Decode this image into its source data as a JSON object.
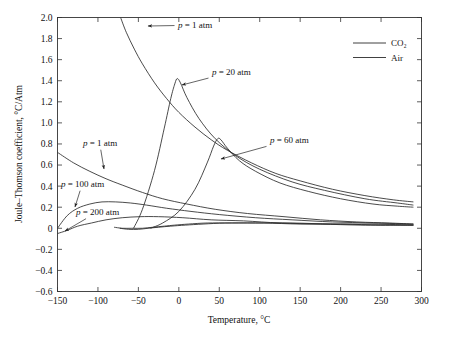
{
  "figure": {
    "background": "#ffffff",
    "line_color": "#2b2b2b",
    "axis_color": "#333333"
  },
  "axes": {
    "x_title": "Temperature, °C",
    "y_title": "Joule–Thomson coefficient, °C/Atm",
    "x_ticks": [
      "−150",
      "−100",
      "−50",
      "0",
      "50",
      "100",
      "150",
      "200",
      "250",
      "300"
    ],
    "x_tick_values": [
      -150,
      -100,
      -50,
      0,
      50,
      100,
      150,
      200,
      250,
      300
    ],
    "y_ticks": [
      "2.0",
      "1.8",
      "1.6",
      "1.4",
      "1.2",
      "1.0",
      "0.8",
      "0.6",
      "0.4",
      "0.2",
      "0",
      "−0.2",
      "−0.4",
      "−0.6"
    ],
    "y_tick_values": [
      2.0,
      1.8,
      1.6,
      1.4,
      1.2,
      1.0,
      0.8,
      0.6,
      0.4,
      0.2,
      0,
      -0.2,
      -0.4,
      -0.6
    ]
  },
  "legend": {
    "position": "top-right",
    "entries": [
      {
        "label": "CO₂",
        "color": "#2b2b2b"
      },
      {
        "label": "Air",
        "color": "#2b2b2b"
      }
    ]
  },
  "annotations": [
    {
      "id": "co2-1atm",
      "text": "p = 1 atm",
      "x": 178,
      "y": 25,
      "arrow_to_x": 148,
      "arrow_to_y": 26
    },
    {
      "id": "co2-20atm",
      "text": "p = 20 atm",
      "x": 212,
      "y": 72,
      "arrow_to_x": 182,
      "arrow_to_y": 85
    },
    {
      "id": "co2-60atm",
      "text": "p = 60 atm",
      "x": 270,
      "y": 140,
      "arrow_to_x": 221,
      "arrow_to_y": 159
    },
    {
      "id": "air-1atm",
      "text": "p = 1 atm",
      "x": 83,
      "y": 143,
      "arrow_to_x": 104,
      "arrow_to_y": 169
    },
    {
      "id": "air-100atm",
      "text": "p = 100 atm",
      "x": 61,
      "y": 184,
      "arrow_to_x": 75,
      "arrow_to_y": 207
    },
    {
      "id": "air-200atm",
      "text": "p = 200 atm",
      "x": 76,
      "y": 212,
      "arrow_to_x": 65,
      "arrow_to_y": 231
    }
  ],
  "chart_data": {
    "type": "line",
    "title": "",
    "xlabel": "Temperature, °C",
    "ylabel": "Joule–Thomson coefficient, °C/Atm",
    "xlim": [
      -150,
      300
    ],
    "ylim": [
      -0.6,
      2.0
    ],
    "grid": false,
    "legend_position": "top-right",
    "series": [
      {
        "name": "CO2, p = 1 atm",
        "gas": "CO₂",
        "pressure_atm": 1,
        "x": [
          -72,
          -65,
          -55,
          -45,
          -30,
          -15,
          0,
          20,
          40,
          60,
          90,
          120,
          150,
          190,
          230,
          265,
          290
        ],
        "y": [
          2.0,
          1.86,
          1.7,
          1.56,
          1.38,
          1.23,
          1.1,
          0.96,
          0.84,
          0.74,
          0.62,
          0.52,
          0.45,
          0.37,
          0.31,
          0.27,
          0.25
        ]
      },
      {
        "name": "CO2, p = 20 atm",
        "gas": "CO₂",
        "pressure_atm": 20,
        "x": [
          -56,
          -45,
          -30,
          -18,
          -10,
          -5,
          -2,
          2,
          10,
          25,
          45,
          70,
          100,
          140,
          180,
          230,
          270,
          290
        ],
        "y": [
          0.0,
          0.18,
          0.55,
          0.95,
          1.23,
          1.37,
          1.42,
          1.38,
          1.24,
          1.04,
          0.85,
          0.69,
          0.56,
          0.44,
          0.36,
          0.28,
          0.24,
          0.22
        ]
      },
      {
        "name": "CO2, p = 60 atm",
        "gas": "CO₂",
        "pressure_atm": 60,
        "x": [
          -35,
          -20,
          0,
          20,
          35,
          43,
          48,
          52,
          60,
          75,
          95,
          125,
          160,
          200,
          240,
          270,
          290
        ],
        "y": [
          0.0,
          0.05,
          0.16,
          0.37,
          0.62,
          0.78,
          0.85,
          0.84,
          0.76,
          0.64,
          0.54,
          0.43,
          0.35,
          0.28,
          0.23,
          0.21,
          0.2
        ]
      },
      {
        "name": "Air, p = 1 atm",
        "gas": "Air",
        "pressure_atm": 1,
        "x": [
          -150,
          -130,
          -110,
          -90,
          -70,
          -45,
          -20,
          10,
          45,
          85,
          130,
          175,
          220,
          260,
          290
        ],
        "y": [
          0.72,
          0.62,
          0.54,
          0.47,
          0.41,
          0.34,
          0.28,
          0.23,
          0.18,
          0.14,
          0.11,
          0.08,
          0.06,
          0.05,
          0.04
        ]
      },
      {
        "name": "Air, p = 100 atm",
        "gas": "Air",
        "pressure_atm": 100,
        "x": [
          -150,
          -138,
          -125,
          -110,
          -95,
          -78,
          -60,
          -40,
          -15,
          15,
          50,
          95,
          140,
          190,
          240,
          290
        ],
        "y": [
          0.0,
          0.12,
          0.19,
          0.23,
          0.25,
          0.25,
          0.24,
          0.22,
          0.19,
          0.16,
          0.13,
          0.1,
          0.08,
          0.06,
          0.05,
          0.04
        ]
      },
      {
        "name": "Air, p = 200 atm",
        "gas": "Air",
        "pressure_atm": 200,
        "x": [
          -150,
          -138,
          -125,
          -108,
          -90,
          -70,
          -48,
          -25,
          5,
          40,
          80,
          125,
          175,
          225,
          270,
          290
        ],
        "y": [
          -0.05,
          -0.02,
          0.02,
          0.05,
          0.08,
          0.1,
          0.11,
          0.11,
          0.1,
          0.08,
          0.07,
          0.05,
          0.04,
          0.03,
          0.03,
          0.03
        ]
      },
      {
        "name": "CO2, p = 200 atm (low branch)",
        "gas": "CO₂",
        "pressure_atm": 200,
        "x": [
          -80,
          -70,
          -58,
          -45,
          -32,
          -18,
          -5,
          12,
          35,
          65,
          105,
          150,
          200,
          250,
          290
        ],
        "y": [
          0.01,
          0.0,
          0.0,
          0.0,
          0.01,
          0.02,
          0.03,
          0.04,
          0.05,
          0.05,
          0.05,
          0.04,
          0.04,
          0.03,
          0.03
        ]
      },
      {
        "name": "CO2, p = 100 atm (low branch)",
        "gas": "CO₂",
        "pressure_atm": 100,
        "x": [
          -73,
          -62,
          -50,
          -38,
          -25,
          -10,
          8,
          30,
          58,
          95,
          140,
          190,
          240,
          290
        ],
        "y": [
          0.0,
          -0.01,
          -0.01,
          0.0,
          0.01,
          0.02,
          0.03,
          0.04,
          0.05,
          0.05,
          0.05,
          0.04,
          0.04,
          0.03
        ]
      }
    ]
  }
}
